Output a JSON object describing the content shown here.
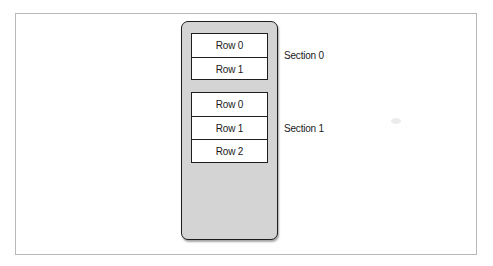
{
  "diagram": {
    "title": "",
    "table_view": {
      "sections": [
        {
          "label": "Section 0",
          "rows": [
            {
              "label": "Row 0"
            },
            {
              "label": "Row 1"
            }
          ]
        },
        {
          "label": "Section 1",
          "rows": [
            {
              "label": "Row 0"
            },
            {
              "label": "Row 1"
            },
            {
              "label": "Row 2"
            }
          ]
        }
      ]
    },
    "colors": {
      "background": "#ffffff",
      "container_fill": "#d4d4d4",
      "cell_fill": "#ffffff",
      "stroke": "#1e1e1e",
      "frame_border": "#b8b8b8"
    }
  }
}
